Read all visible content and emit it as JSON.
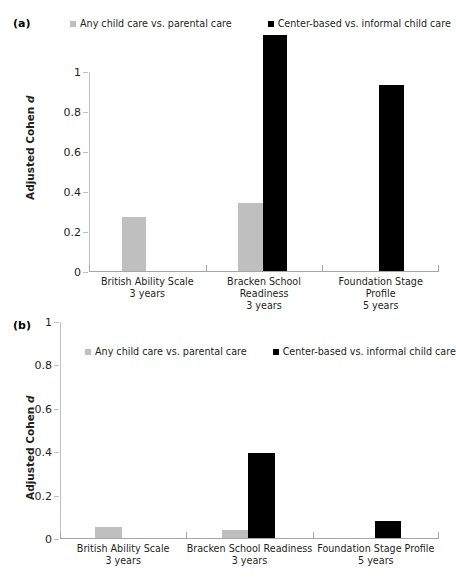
{
  "figure": {
    "panels": [
      {
        "letter": "(a)",
        "ylabel_prefix": "Adjusted Cohen ",
        "ylabel_italic": "d"
      },
      {
        "letter": "(b)",
        "ylabel_prefix": "Adjusted Cohen ",
        "ylabel_italic": "d"
      }
    ],
    "legend": [
      {
        "label": "Any child care vs. parental care",
        "color": "#bfbfbf"
      },
      {
        "label": "Center-based vs. informal child care",
        "color": "#000000"
      }
    ]
  },
  "chart_data": [
    {
      "type": "bar",
      "panel": "(a)",
      "title": "",
      "xlabel": "",
      "ylabel": "Adjusted Cohen d",
      "ylim": [
        0,
        1
      ],
      "yticks": [
        "0",
        "0.2",
        "0.4",
        "0.6",
        "0.8",
        "1"
      ],
      "ytick_values": [
        0,
        0.2,
        0.4,
        0.6,
        0.8,
        1
      ],
      "grid": false,
      "legend_position": "top",
      "categories": [
        "British Ability Scale\n3 years",
        "Bracken School Readiness\n3 years",
        "Foundation Stage Profile\n5 years"
      ],
      "category_lines": [
        [
          "British Ability Scale",
          "3 years"
        ],
        [
          "Bracken School Readiness",
          "3 years"
        ],
        [
          "Foundation Stage Profile",
          "5 years"
        ]
      ],
      "series": [
        {
          "name": "Any child care vs. parental care",
          "color": "#bfbfbf",
          "values": [
            0.27,
            0.34,
            null
          ]
        },
        {
          "name": "Center-based vs. informal child care",
          "color": "#000000",
          "values": [
            null,
            1.18,
            0.93
          ]
        }
      ],
      "notes": "Bracken black bar (1.18) exceeds the plotted y-axis maximum of 1."
    },
    {
      "type": "bar",
      "panel": "(b)",
      "title": "",
      "xlabel": "",
      "ylabel": "Adjusted Cohen d",
      "ylim": [
        0,
        1
      ],
      "yticks": [
        "0",
        "0.2",
        "0.4",
        "0.6",
        "0.8",
        "1"
      ],
      "ytick_values": [
        0,
        0.2,
        0.4,
        0.6,
        0.8,
        1
      ],
      "grid": false,
      "legend_position": "inside-top",
      "categories": [
        "British Ability Scale\n3 years",
        "Bracken School Readiness\n3 years",
        "Foundation Stage Profile\n5 years"
      ],
      "category_lines": [
        [
          "British Ability Scale",
          "3 years"
        ],
        [
          "Bracken School Readiness",
          "3 years"
        ],
        [
          "Foundation Stage Profile",
          "5 years"
        ]
      ],
      "series": [
        {
          "name": "Any child care vs. parental care",
          "color": "#bfbfbf",
          "values": [
            0.05,
            0.035,
            null
          ]
        },
        {
          "name": "Center-based vs. informal child care",
          "color": "#000000",
          "values": [
            null,
            0.39,
            0.08
          ]
        }
      ]
    }
  ]
}
